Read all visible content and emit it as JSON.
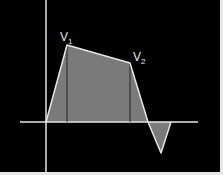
{
  "diagram": {
    "labels": {
      "v1": {
        "main": "V",
        "sub": "1"
      },
      "v2": {
        "main": "V",
        "sub": "2"
      }
    },
    "colors": {
      "background": "#000000",
      "axis": "#e6e6e6",
      "curve": "#e6e6e6",
      "fill": "#7a7a7a",
      "border": "#e8e8e8"
    }
  }
}
